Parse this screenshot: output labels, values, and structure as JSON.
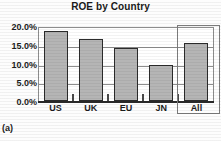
{
  "chart_data": {
    "type": "bar",
    "title": "ROE by Country",
    "xlabel": "",
    "ylabel": "",
    "categories": [
      "US",
      "UK",
      "EU",
      "JN",
      "All"
    ],
    "values": [
      0.192,
      0.17,
      0.145,
      0.1,
      0.16
    ],
    "value_labels": [
      "19.2%",
      "17.0%",
      "14.5%",
      "10.0%",
      "16.0%"
    ],
    "ylim": [
      0,
      0.2
    ],
    "ytick_labels": [
      "20.0%",
      "15.0%",
      "10.0%",
      "5.0%",
      "0.0%"
    ],
    "ytick_values": [
      0.2,
      0.15,
      0.1,
      0.05,
      0.0
    ],
    "grid": true,
    "legend": "none",
    "annotations": {
      "highlight": {
        "target_category": "All",
        "style": "rectangle-outline"
      }
    },
    "colors": {
      "bar_fill": "#b5b5b5",
      "bar_border": "#2b2b2b",
      "grid": "#8d8d8d",
      "axis": "#2a2a2a",
      "highlight": "#7b7b7b",
      "text": "#1c1c1c"
    }
  },
  "caption": {
    "label": "(a)"
  }
}
